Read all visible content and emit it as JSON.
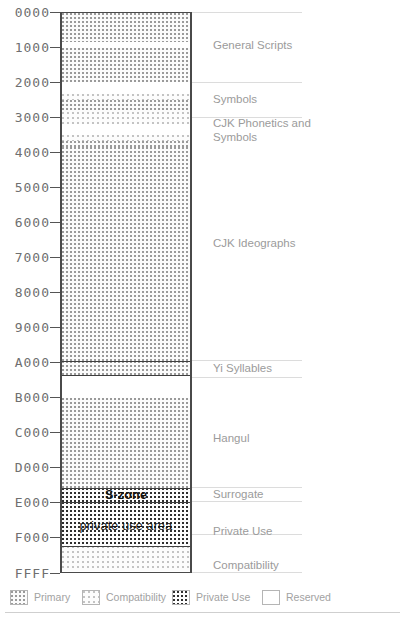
{
  "chart_data": {
    "type": "bar",
    "xlabel": "",
    "ylabel": "",
    "orientation": "vertical-stacked",
    "grid": false,
    "legend_position": "bottom",
    "axis": {
      "type": "hexadecimal code point",
      "min": "0000",
      "max": "FFFF",
      "tick_labels": [
        "0000",
        "1000",
        "2000",
        "3000",
        "4000",
        "5000",
        "6000",
        "7000",
        "8000",
        "9000",
        "A000",
        "B000",
        "C000",
        "D000",
        "E000",
        "F000",
        "FFFF"
      ],
      "tick_values": [
        0,
        4096,
        8192,
        12288,
        16384,
        20480,
        24576,
        28672,
        32768,
        36864,
        40960,
        45056,
        49152,
        53248,
        57344,
        61440,
        65535
      ]
    },
    "categories": [
      "Primary",
      "Compatibility",
      "Private Use",
      "Reserved"
    ],
    "bands": [
      {
        "name": "General Scripts",
        "fill": "primary",
        "start": "0000",
        "end": "0590",
        "start_value": 0,
        "end_value": 1424
      },
      {
        "name": "General Scripts",
        "fill": "reserved",
        "start": "0590",
        "end": "0700",
        "start_value": 1424,
        "end_value": 1792
      },
      {
        "name": "General Scripts",
        "fill": "primary",
        "start": "0700",
        "end": "1680",
        "start_value": 1792,
        "end_value": 5760
      },
      {
        "name": "General Scripts",
        "fill": "reserved",
        "start": "1680",
        "end": "2000",
        "start_value": 5760,
        "end_value": 8192
      },
      {
        "name": "Symbols",
        "fill": "compat",
        "start": "2000",
        "end": "2200",
        "start_value": 8192,
        "end_value": 8704
      },
      {
        "name": "Symbols",
        "fill": "primary",
        "start": "2200",
        "end": "2500",
        "start_value": 8704,
        "end_value": 9472
      },
      {
        "name": "Symbols",
        "fill": "compat",
        "start": "2500",
        "end": "2800",
        "start_value": 9472,
        "end_value": 10240
      },
      {
        "name": "Symbols",
        "fill": "reserved",
        "start": "2800",
        "end": "3000",
        "start_value": 10240,
        "end_value": 12288
      },
      {
        "name": "CJK Phonetics and Symbols",
        "fill": "compat",
        "start": "3000",
        "end": "3200",
        "start_value": 12288,
        "end_value": 12800
      },
      {
        "name": "CJK Phonetics and Symbols",
        "fill": "primary",
        "start": "3200",
        "end": "3400",
        "start_value": 12800,
        "end_value": 13312
      },
      {
        "name": "CJK Ideographs",
        "fill": "primary",
        "start": "3400",
        "end": "A000",
        "start_value": 13312,
        "end_value": 40960
      },
      {
        "name": "Yi Syllables",
        "fill": "primary",
        "start": "A000",
        "end": "A4D0",
        "start_value": 40960,
        "end_value": 42192
      },
      {
        "name": "Yi Syllables",
        "fill": "reserved",
        "start": "A4D0",
        "end": "AC00",
        "start_value": 42192,
        "end_value": 44032
      },
      {
        "name": "Hangul",
        "fill": "primary",
        "start": "AC00",
        "end": "D800",
        "start_value": 44032,
        "end_value": 55296
      },
      {
        "name": "Surrogate",
        "fill": "private",
        "start": "D800",
        "end": "E000",
        "start_value": 55296,
        "end_value": 57344,
        "inline_label": "S-zone"
      },
      {
        "name": "Private Use",
        "fill": "private",
        "start": "E000",
        "end": "F900",
        "start_value": 57344,
        "end_value": 63744,
        "inline_label": "private use area"
      },
      {
        "name": "Compatibility",
        "fill": "compat",
        "start": "F900",
        "end": "FFFF",
        "start_value": 63744,
        "end_value": 65535
      }
    ],
    "region_labels": [
      {
        "text": "General Scripts",
        "at": "0B00"
      },
      {
        "text": "Symbols",
        "at": "2500"
      },
      {
        "text": "CJK Phonetics and\nSymbols",
        "at": "3200"
      },
      {
        "text": "CJK Ideographs",
        "at": "6900"
      },
      {
        "text": "Yi Syllables",
        "at": "A200"
      },
      {
        "text": "Hangul",
        "at": "C400"
      },
      {
        "text": "Surrogate",
        "at": "DC00"
      },
      {
        "text": "Private Use",
        "at": "F100"
      },
      {
        "text": "Compatibility",
        "at": "FC00"
      }
    ],
    "legend": [
      {
        "label": "Primary",
        "fill": "primary"
      },
      {
        "label": "Compatibility",
        "fill": "compat"
      },
      {
        "label": "Private Use",
        "fill": "private"
      },
      {
        "label": "Reserved",
        "fill": "reserved"
      }
    ]
  },
  "axis": {
    "ticks": [
      {
        "label": "0000",
        "y": 12
      },
      {
        "label": "1000",
        "y": 47
      },
      {
        "label": "2000",
        "y": 82
      },
      {
        "label": "3000",
        "y": 117
      },
      {
        "label": "4000",
        "y": 152
      },
      {
        "label": "5000",
        "y": 187
      },
      {
        "label": "6000",
        "y": 222
      },
      {
        "label": "7000",
        "y": 257
      },
      {
        "label": "8000",
        "y": 292
      },
      {
        "label": "9000",
        "y": 327
      },
      {
        "label": "A000",
        "y": 362
      },
      {
        "label": "B000",
        "y": 397
      },
      {
        "label": "C000",
        "y": 432
      },
      {
        "label": "D000",
        "y": 467
      },
      {
        "label": "E000",
        "y": 502
      },
      {
        "label": "F000",
        "y": 537
      },
      {
        "label": "FFFF",
        "y": 573
      }
    ]
  },
  "bar": {
    "bands": [
      {
        "fill": "primary",
        "top": 0,
        "height": 29
      },
      {
        "fill": "reserved",
        "top": 29,
        "height": 6
      },
      {
        "fill": "primary",
        "top": 35,
        "height": 34
      },
      {
        "fill": "reserved",
        "top": 69,
        "height": 12
      },
      {
        "fill": "compat",
        "top": 81,
        "height": 6
      },
      {
        "fill": "primary",
        "top": 87,
        "height": 12
      },
      {
        "fill": "compat",
        "top": 99,
        "height": 12
      },
      {
        "fill": "reserved",
        "top": 111,
        "height": 11
      },
      {
        "fill": "compat",
        "top": 122,
        "height": 6
      },
      {
        "fill": "primary",
        "top": 128,
        "height": 6
      },
      {
        "fill": "primary",
        "top": 134,
        "height": 214
      },
      {
        "fill": "primary",
        "top": 348,
        "height": 14
      },
      {
        "fill": "reserved",
        "top": 362,
        "height": 23
      },
      {
        "fill": "primary",
        "top": 385,
        "height": 90
      },
      {
        "fill": "private",
        "top": 475,
        "height": 14
      },
      {
        "fill": "private",
        "top": 489,
        "height": 44
      },
      {
        "fill": "compat",
        "top": 533,
        "height": 25
      }
    ],
    "rules": [
      348,
      362,
      475,
      489,
      533
    ],
    "inline": [
      {
        "key": "szone",
        "text": "S-zone",
        "y": 482
      },
      {
        "key": "pua",
        "text": "private use area",
        "y": 513
      }
    ]
  },
  "separators": [
    12,
    82,
    117,
    360,
    377,
    487,
    501,
    534,
    572
  ],
  "labels": [
    {
      "text": "General Scripts",
      "y": 45,
      "lines": 1
    },
    {
      "text": "Symbols",
      "y": 99,
      "lines": 1
    },
    {
      "text": "CJK Phonetics and\nSymbols",
      "y": 130,
      "lines": 2
    },
    {
      "text": "CJK Ideographs",
      "y": 243,
      "lines": 1
    },
    {
      "text": "Yi Syllables",
      "y": 368,
      "lines": 1
    },
    {
      "text": "Hangul",
      "y": 438,
      "lines": 1
    },
    {
      "text": "Surrogate",
      "y": 494,
      "lines": 1
    },
    {
      "text": "Private Use",
      "y": 531,
      "lines": 1
    },
    {
      "text": "Compatibility",
      "y": 565,
      "lines": 1
    }
  ],
  "legend": {
    "items": [
      {
        "label": "Primary",
        "fill": "primary",
        "x": 10
      },
      {
        "label": "Compatibility",
        "fill": "compat",
        "x": 82
      },
      {
        "label": "Private Use",
        "fill": "private",
        "x": 172
      },
      {
        "label": "Reserved",
        "fill": "reserved",
        "x": 262
      }
    ]
  }
}
